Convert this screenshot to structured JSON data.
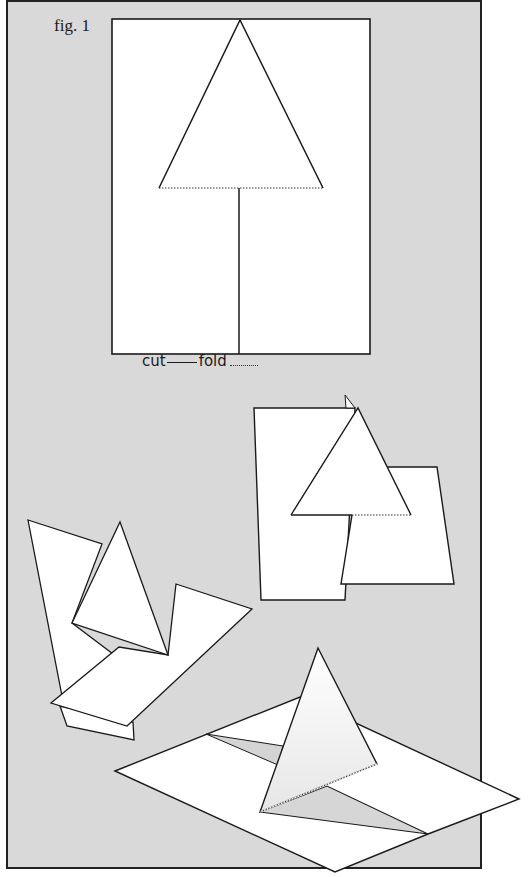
{
  "figure": {
    "label": "fig. 1",
    "background_color": "#d9d9d9",
    "paper_color": "#ffffff",
    "line_color": "#1a1a1a"
  },
  "legend": {
    "cut_label": "cut",
    "fold_label": "fold",
    "cut_style": "solid",
    "fold_style": "dotted"
  },
  "steps": [
    {
      "id": "flat-template",
      "description": "Flat sheet with triangle outline, cut lines solid, fold line dotted"
    },
    {
      "id": "cut-and-split",
      "description": "Sheet cut along center line and triangle sides, halves offset"
    },
    {
      "id": "partially-folded",
      "description": "Halves rotated apart, triangle tab lifting"
    },
    {
      "id": "pop-up-standing",
      "description": "Triangle tab folded up standing on flat sheet"
    }
  ]
}
